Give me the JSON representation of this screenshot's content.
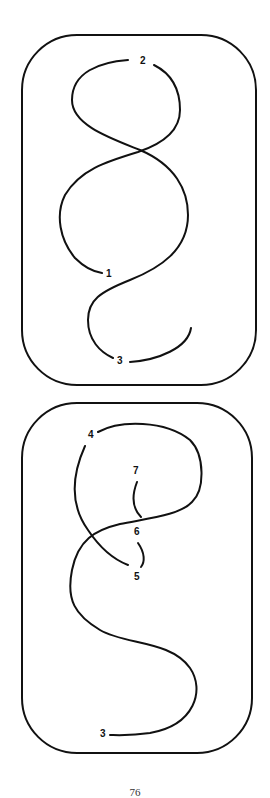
{
  "figures": [
    {
      "name": "top-knot-diagram",
      "labels": [
        {
          "text": "2",
          "x": 140,
          "y": 64
        },
        {
          "text": "1",
          "x": 108,
          "y": 277
        },
        {
          "text": "3",
          "x": 119,
          "y": 363
        }
      ]
    },
    {
      "name": "bottom-knot-diagram",
      "labels": [
        {
          "text": "4",
          "x": 90,
          "y": 438
        },
        {
          "text": "7",
          "x": 135,
          "y": 473
        },
        {
          "text": "6",
          "x": 135,
          "y": 535
        },
        {
          "text": "5",
          "x": 134,
          "y": 579
        },
        {
          "text": "3",
          "x": 101,
          "y": 736
        }
      ]
    }
  ],
  "page": {
    "number": "76"
  }
}
